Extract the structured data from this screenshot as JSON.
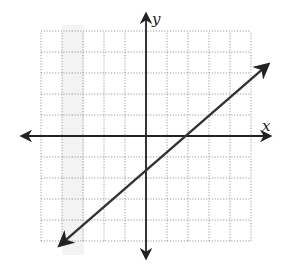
{
  "chart_data": {
    "type": "line",
    "title": "",
    "xlabel": "x",
    "ylabel": "y",
    "xlim": [
      -5,
      5
    ],
    "ylim": [
      -5,
      5
    ],
    "grid": true,
    "grid_step": 1,
    "tick_labels": false,
    "series": [
      {
        "name": "line",
        "points": [
          [
            -4.1,
            -5.2
          ],
          [
            5.8,
            3.4
          ]
        ],
        "arrows": "both"
      }
    ],
    "axes": {
      "x_arrows": "both",
      "y_arrows": "both"
    },
    "colors": {
      "grid": "#9a9a9a",
      "axes": "#222222",
      "line": "#333333",
      "shading": "#ececec"
    }
  }
}
